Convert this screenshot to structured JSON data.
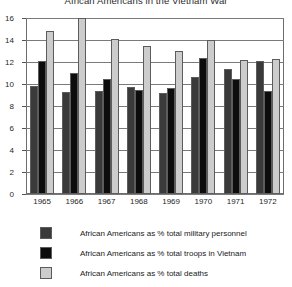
{
  "chart_data": {
    "type": "bar",
    "title": "African Americans in the Vietnam War",
    "xlabel": "",
    "ylabel": "",
    "ylim": [
      0,
      16
    ],
    "yticks": [
      0,
      2,
      4,
      6,
      8,
      10,
      12,
      14,
      16
    ],
    "grid": true,
    "legend_position": "bottom",
    "categories": [
      "1965",
      "1966",
      "1967",
      "1968",
      "1969",
      "1970",
      "1971",
      "1972"
    ],
    "series": [
      {
        "name": "African Americans as % total military personnel",
        "color": "#3a3a3a",
        "values": [
          9.8,
          9.3,
          9.4,
          9.7,
          9.2,
          10.6,
          11.4,
          12.1
        ]
      },
      {
        "name": "African Americans as % total troops in Vietnam",
        "color": "#0d0d0d",
        "values": [
          12.1,
          11.0,
          10.5,
          9.5,
          9.6,
          12.4,
          10.5,
          9.4
        ]
      },
      {
        "name": "African Americans as % total deaths",
        "color": "#cccccc",
        "values": [
          14.8,
          16.3,
          14.1,
          13.5,
          13.0,
          14.0,
          12.2,
          12.3
        ]
      }
    ]
  },
  "legend": {
    "items": [
      "African Americans as % total military personnel",
      "African Americans as % total troops in Vietnam",
      "African Americans as % total deaths"
    ]
  }
}
